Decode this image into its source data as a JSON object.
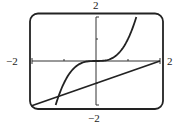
{
  "chart_data": {
    "type": "line",
    "title": "",
    "xlabel": "",
    "ylabel": "",
    "xlim": [
      -2,
      2
    ],
    "ylim": [
      -2,
      2
    ],
    "grid": false,
    "legend": null,
    "x_ticks": [
      -2,
      -1,
      0,
      1,
      2
    ],
    "y_ticks": [
      -2,
      -1,
      0,
      1,
      2
    ],
    "window_labels": {
      "xmin": "−2",
      "xmax": "2",
      "ymin": "−2",
      "ymax": "2"
    },
    "series": [
      {
        "name": "y = x^3",
        "x": [
          -1.26,
          -1.0,
          -0.75,
          -0.5,
          -0.25,
          0,
          0.25,
          0.5,
          0.75,
          1.0,
          1.26
        ],
        "values": [
          -2.0,
          -1.0,
          -0.42,
          -0.125,
          -0.016,
          0,
          0.016,
          0.125,
          0.42,
          1.0,
          2.0
        ]
      },
      {
        "name": "y = x/2 - 1",
        "x": [
          -2,
          -1,
          0,
          1,
          2
        ],
        "values": [
          -2,
          -1.5,
          -1,
          -0.5,
          0
        ]
      }
    ],
    "annotations": [
      {
        "text": "intersection",
        "x": -1.17,
        "y": -1.59
      }
    ],
    "colors": {
      "frame": "#222222",
      "axes": "#333333",
      "curve": "#222222",
      "line": "#222222"
    }
  }
}
